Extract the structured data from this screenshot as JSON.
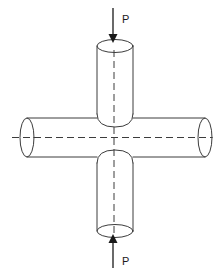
{
  "figure": {
    "type": "engineering-line-diagram",
    "background_color": "#ffffff",
    "line_color": "#3c3c3c",
    "text_color": "#1a1a1a",
    "width": 221,
    "height": 275
  },
  "labels": {
    "top_load": "P",
    "bottom_load": "P"
  },
  "parts": {
    "vertical_cylinder_upper": "vertical-cylinder-upper",
    "vertical_cylinder_lower": "vertical-cylinder-lower",
    "horizontal_cylinder": "horizontal-cylinder",
    "top_arrow": "arrow-down",
    "bottom_arrow": "arrow-up",
    "vertical_centerline": "dashed-centerline-vertical",
    "horizontal_centerline": "dashed-centerline-horizontal"
  },
  "geometry": {
    "center_x": 113,
    "center_y": 137,
    "vertical_cylinder_left": 97,
    "vertical_cylinder_right": 133,
    "horizontal_cylinder_top": 118,
    "horizontal_cylinder_bottom": 157,
    "top_cap_center_y": 46,
    "bottom_cap_center_y": 231,
    "left_cap_center_x": 27,
    "right_cap_center_x": 205,
    "top_arrow_tip_y": 42,
    "top_arrow_tail_y": 8,
    "bottom_arrow_tip_y": 234,
    "bottom_arrow_tail_y": 268,
    "top_label_x": 122,
    "top_label_y": 22,
    "bottom_label_x": 122,
    "bottom_label_y": 262
  }
}
